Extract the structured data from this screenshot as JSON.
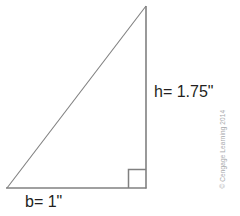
{
  "figure": {
    "background_color": "#ffffff",
    "line_color": "#808080",
    "text_color": "#231f20"
  },
  "labels": {
    "height": "h= 1.75\"",
    "base": "b= 1\""
  },
  "credit": {
    "text": "© Cengage Learning 2014",
    "color": "#a7a9ac"
  },
  "geometry": {
    "type": "right-triangle",
    "vertices": {
      "apex": [
        146,
        6
      ],
      "bottom_left": [
        7,
        188
      ],
      "bottom_right": [
        146,
        188
      ]
    },
    "right_angle_marker": {
      "corner": "bottom-right",
      "size": 18
    },
    "base_length": "1\"",
    "height_length": "1.75\""
  }
}
